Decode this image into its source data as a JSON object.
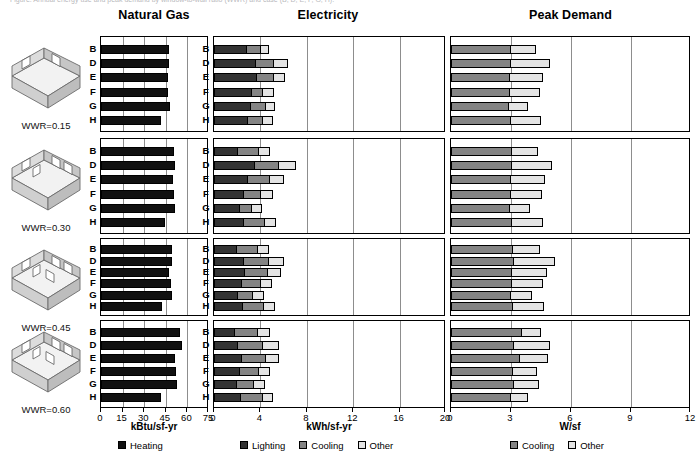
{
  "clipped_caption": "Figure. Annual energy use and peak demand by window-to-wall ratio (WWR) and case (B, D, E, F, G, H).",
  "panels": {
    "gas": {
      "title": "Natural Gas"
    },
    "elec": {
      "title": "Electricity"
    },
    "peak": {
      "title": "Peak Demand"
    }
  },
  "categories": [
    "B",
    "D",
    "E",
    "F",
    "G",
    "H"
  ],
  "wwr_groups": [
    {
      "label": "WWR=0.15"
    },
    {
      "label": "WWR=0.30"
    },
    {
      "label": "WWR=0.45"
    },
    {
      "label": "WWR=0.60"
    }
  ],
  "colors": {
    "heating": "#111111",
    "lighting": "#333333",
    "cooling": "#848484",
    "other": "#e4e4e4",
    "frame": "#000000",
    "gridline": "#8d8d8d"
  },
  "legends": {
    "gas": [
      {
        "label": "Heating",
        "color": "#111111"
      }
    ],
    "elec": [
      {
        "label": "Lighting",
        "color": "#333333"
      },
      {
        "label": "Cooling",
        "color": "#848484"
      },
      {
        "label": "Other",
        "color": "#e4e4e4"
      }
    ],
    "peak": [
      {
        "label": "Cooling",
        "color": "#848484"
      },
      {
        "label": "Other",
        "color": "#e4e4e4"
      }
    ]
  },
  "chart_data": [
    {
      "type": "bar",
      "title": "Natural Gas",
      "xlabel": "kBtu/sf-yr",
      "ylabel": "",
      "xlim": [
        0,
        75
      ],
      "xticks": [
        0,
        15,
        30,
        45,
        60,
        75
      ],
      "grid": true,
      "legend_position": "bottom",
      "categories": [
        "B",
        "D",
        "E",
        "F",
        "G",
        "H"
      ],
      "groups": [
        "WWR=0.15",
        "WWR=0.30",
        "WWR=0.45",
        "WWR=0.60"
      ],
      "series": [
        {
          "name": "Heating",
          "color": "#111111",
          "values_by_group": [
            [
              47.0,
              47.5,
              46.5,
              46.5,
              48.0,
              42.0
            ],
            [
              51.0,
              51.5,
              50.0,
              50.5,
              51.5,
              44.5
            ],
            [
              49.0,
              49.5,
              47.5,
              48.5,
              49.5,
              42.5
            ],
            [
              55.0,
              56.0,
              51.5,
              52.0,
              53.0,
              41.5
            ]
          ]
        }
      ]
    },
    {
      "type": "bar",
      "title": "Electricity",
      "xlabel": "kWh/sf-yr",
      "ylabel": "",
      "xlim": [
        0,
        20
      ],
      "xticks": [
        0,
        4,
        8,
        12,
        16,
        20
      ],
      "grid": true,
      "stacked": true,
      "legend_position": "bottom",
      "categories": [
        "B",
        "D",
        "E",
        "F",
        "G",
        "H"
      ],
      "groups": [
        "WWR=0.15",
        "WWR=0.30",
        "WWR=0.45",
        "WWR=0.60"
      ],
      "series": [
        {
          "name": "Lighting",
          "color": "#333333",
          "values_by_group": [
            [
              2.85,
              3.6,
              3.7,
              3.25,
              3.2,
              2.9
            ],
            [
              2.1,
              3.55,
              2.9,
              2.55,
              2.2,
              2.6
            ],
            [
              1.95,
              2.6,
              2.65,
              2.4,
              2.05,
              2.5
            ],
            [
              1.85,
              2.05,
              2.45,
              2.2,
              1.95,
              2.35
            ]
          ]
        },
        {
          "name": "Cooling",
          "color": "#848484",
          "values_by_group": [
            [
              1.3,
              1.7,
              1.55,
              1.1,
              1.35,
              1.4
            ],
            [
              1.85,
              2.15,
              2.05,
              1.6,
              1.2,
              1.85
            ],
            [
              1.9,
              2.2,
              2.1,
              1.7,
              1.4,
              1.9
            ],
            [
              2.0,
              2.3,
              2.15,
              1.8,
              1.55,
              1.95
            ]
          ]
        },
        {
          "name": "Other",
          "color": "#e4e4e4",
          "values_by_group": [
            [
              0.8,
              1.25,
              1.05,
              1.0,
              0.9,
              0.95
            ],
            [
              1.05,
              1.55,
              1.25,
              1.1,
              0.95,
              1.1
            ],
            [
              1.1,
              1.45,
              1.2,
              1.05,
              1.0,
              1.05
            ],
            [
              1.15,
              1.4,
              1.15,
              1.0,
              1.05,
              1.0
            ]
          ]
        }
      ]
    },
    {
      "type": "bar",
      "title": "Peak Demand",
      "xlabel": "W/sf",
      "ylabel": "",
      "xlim": [
        0,
        12
      ],
      "xticks": [
        0,
        3,
        6,
        9,
        12
      ],
      "grid": true,
      "stacked": true,
      "legend_position": "bottom",
      "categories": [
        "B",
        "D",
        "E",
        "F",
        "G",
        "H"
      ],
      "groups": [
        "WWR=0.15",
        "WWR=0.30",
        "WWR=0.45",
        "WWR=0.60"
      ],
      "series": [
        {
          "name": "Cooling",
          "color": "#848484",
          "values_by_group": [
            [
              3.0,
              3.0,
              2.95,
              2.95,
              2.9,
              3.0
            ],
            [
              3.05,
              3.05,
              3.0,
              3.0,
              2.95,
              3.05
            ],
            [
              3.1,
              3.15,
              3.05,
              3.05,
              3.0,
              3.1
            ],
            [
              3.55,
              3.15,
              3.45,
              3.1,
              3.15,
              3.0
            ]
          ]
        },
        {
          "name": "Other",
          "color": "#e4e4e4",
          "values_by_group": [
            [
              1.3,
              2.0,
              1.7,
              1.55,
              1.0,
              1.55
            ],
            [
              1.35,
              2.05,
              1.75,
              1.6,
              1.05,
              1.6
            ],
            [
              1.4,
              2.1,
              1.8,
              1.6,
              1.1,
              1.6
            ],
            [
              1.0,
              1.85,
              1.45,
              1.25,
              1.3,
              0.9
            ]
          ]
        }
      ]
    }
  ]
}
